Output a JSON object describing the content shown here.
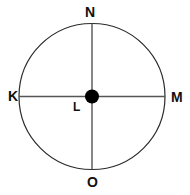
{
  "figure": {
    "canvas": {
      "width": 190,
      "height": 195,
      "background": "#ffffff"
    },
    "circle": {
      "name": "outer-circle",
      "center_x": 92,
      "center_y": 96.5,
      "radius": 73,
      "stroke_color": "#2b2b2b",
      "stroke_width": 1.2,
      "fill": "none"
    },
    "center_point": {
      "name": "center-point-L",
      "x": 92,
      "y": 96.5,
      "radius": 7,
      "fill": "#000000"
    },
    "lines": [
      {
        "name": "vertical-diameter",
        "from_label": "N",
        "to_label": "O",
        "x1": 92,
        "y1": 23.5,
        "x2": 92,
        "y2": 169.5,
        "stroke_color": "#555555",
        "stroke_width": 1.4
      },
      {
        "name": "horizontal-diameter",
        "from_label": "K",
        "to_label": "M",
        "x1": 19,
        "y1": 96.5,
        "x2": 165,
        "y2": 96.5,
        "stroke_color": "#555555",
        "stroke_width": 1.4
      }
    ],
    "labels": [
      {
        "id": "N",
        "text": "N",
        "position": "top",
        "x": 92,
        "y": 12,
        "color": "#111111"
      },
      {
        "id": "K",
        "text": "K",
        "position": "left",
        "x": 12,
        "y": 96,
        "color": "#111111"
      },
      {
        "id": "M",
        "text": "M",
        "position": "right",
        "x": 176,
        "y": 97,
        "color": "#111111"
      },
      {
        "id": "O",
        "text": "O",
        "position": "bottom",
        "x": 93,
        "y": 182,
        "color": "#111111"
      },
      {
        "id": "L",
        "text": "L",
        "position": "center",
        "x": 77,
        "y": 107,
        "color": "#111111"
      }
    ]
  }
}
